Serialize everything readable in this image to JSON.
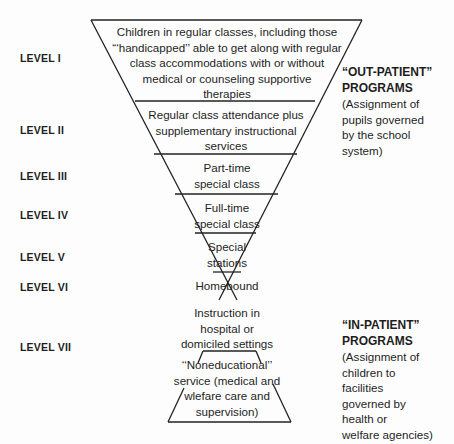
{
  "levels": [
    {
      "label": "LEVEL I"
    },
    {
      "label": "LEVEL II"
    },
    {
      "label": "LEVEL III"
    },
    {
      "label": "LEVEL IV"
    },
    {
      "label": "LEVEL V"
    },
    {
      "label": "LEVEL VI"
    },
    {
      "label": "LEVEL VII"
    }
  ],
  "tiers": [
    {
      "lines": [
        "Children in regular classes, including those",
        "“‘handicapped’’ able to get along with regular",
        "class accommodations with or without",
        "medical or counseling supportive",
        "therapies"
      ]
    },
    {
      "lines": [
        "Regular class attendance plus",
        "supplementary instructional",
        "services"
      ]
    },
    {
      "lines": [
        "Part-time",
        "special class"
      ]
    },
    {
      "lines": [
        "Full-time",
        "special class"
      ]
    },
    {
      "lines": [
        "Special",
        "stations"
      ]
    },
    {
      "lines": [
        "Homebound"
      ]
    },
    {
      "lines": [
        "Instruction in",
        "hospital or",
        "domiciled settings"
      ]
    },
    {
      "lines": [
        "‘‘Noneducational’’",
        "service (medical and",
        "wlefare care and",
        "supervision)"
      ]
    }
  ],
  "outpatient": {
    "heading": [
      "“OUT-PATIENT”",
      "PROGRAMS"
    ],
    "desc": [
      "(Assignment of",
      "pupils governed",
      "by the school",
      "system)"
    ]
  },
  "inpatient": {
    "heading": [
      "“IN-PATIENT”",
      "PROGRAMS"
    ],
    "desc": [
      "(Assignment of",
      "children to",
      "facilities",
      "governed by",
      "health or",
      "welfare agencies)"
    ]
  }
}
